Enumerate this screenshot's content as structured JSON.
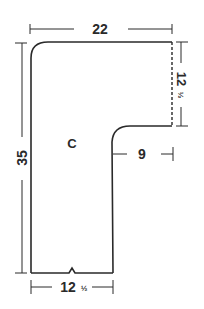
{
  "diagram": {
    "piece_label": "C",
    "colors": {
      "ink": "#2a2a2a",
      "background": "#ffffff"
    },
    "dimensions": {
      "top_width": {
        "value": "22",
        "label": "22"
      },
      "left_height": {
        "value": "35",
        "label": "35"
      },
      "right_height": {
        "whole": "12",
        "fraction": "1/2",
        "label": "12½"
      },
      "inner_step": {
        "value": "9",
        "label": "9"
      },
      "bottom_width": {
        "whole": "12",
        "fraction": "1/2",
        "label": "12½"
      }
    },
    "fraction_glyph": "½"
  }
}
